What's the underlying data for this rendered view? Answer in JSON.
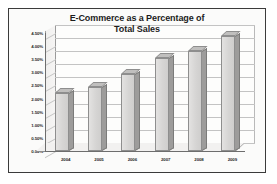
{
  "chart_data": {
    "type": "bar",
    "title": "E-Commerce as a Percentage of Total Sales",
    "title_line1": "E-Commerce as a Percentage of",
    "title_line2": "Total Sales",
    "xlabel": "",
    "ylabel": "",
    "categories": [
      "2004",
      "2005",
      "2006",
      "2007",
      "2008",
      "2009"
    ],
    "values": [
      2.2,
      2.45,
      2.95,
      3.55,
      3.8,
      4.4
    ],
    "ylim": [
      0.0,
      4.5
    ],
    "ytick_labels": [
      "4.50%",
      "4.00%",
      "3.50%",
      "3.00%",
      "2.50%",
      "2.00%",
      "1.50%",
      "1.00%",
      "0.50%",
      "0.00%"
    ],
    "ytick_values": [
      4.5,
      4.0,
      3.5,
      3.0,
      2.5,
      2.0,
      1.5,
      1.0,
      0.5,
      0.0
    ],
    "grid": true,
    "legend": null,
    "series": [
      {
        "name": "E-Commerce Percentage of Total Sales",
        "values": [
          2.2,
          2.45,
          2.95,
          3.55,
          3.8,
          4.4
        ]
      }
    ],
    "style": "3d-column",
    "colors": {
      "bar_face": "#d6d5d4",
      "bar_side": "#9d9c9b",
      "bar_top": "#c0bfbe",
      "bar_border": "#8e8e8e",
      "plot_background": "#fdfdfc",
      "gridline": "#c3c3c3",
      "axis": "#6d6d6d",
      "frame_border": "#3b3b3b",
      "text": "#1c1c1c",
      "page_background": "#ffffff"
    }
  }
}
